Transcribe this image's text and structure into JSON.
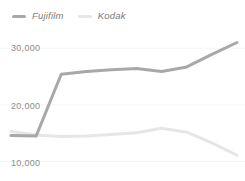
{
  "chart_data": {
    "type": "line",
    "title": "",
    "subtitle": "",
    "xlabel": "",
    "ylabel": "",
    "ylim": [
      8000,
      32500
    ],
    "yticks": [
      30000,
      20000,
      10000
    ],
    "ytick_labels": [
      "30,000",
      "20,000",
      "10,000"
    ],
    "xticks": [],
    "xtick_labels": [],
    "grid": "horizontal",
    "legend_position": "top-left",
    "x": [
      0,
      1,
      2,
      3,
      4,
      5,
      6,
      7,
      8,
      9
    ],
    "series": [
      {
        "name": "Fujifilm",
        "color": "#a8a8a8",
        "values": [
          14600,
          14500,
          25400,
          25900,
          26200,
          26400,
          25900,
          26700,
          28900,
          31000
        ]
      },
      {
        "name": "Kodak",
        "color": "#e6e6e6",
        "values": [
          15300,
          14700,
          14450,
          14500,
          14800,
          15100,
          15900,
          15200,
          13300,
          11100
        ]
      }
    ]
  },
  "legend": {
    "items": [
      {
        "label": "Fujifilm",
        "swatch_name": "legend-swatch-fujifilm",
        "color": "#a8a8a8"
      },
      {
        "label": "Kodak",
        "swatch_name": "legend-swatch-kodak",
        "color": "#e6e6e6"
      }
    ]
  },
  "axis": {
    "y_tick_labels": [
      "30,000",
      "20,000",
      "10,000"
    ]
  },
  "colors": {
    "background": "#ffffff",
    "gridline": "#f4f4f4",
    "tick_text": "#8c8c8c",
    "legend_text": "#7c7c7c",
    "series_fujifilm": "#a8a8a8",
    "series_kodak": "#e6e6e6"
  }
}
